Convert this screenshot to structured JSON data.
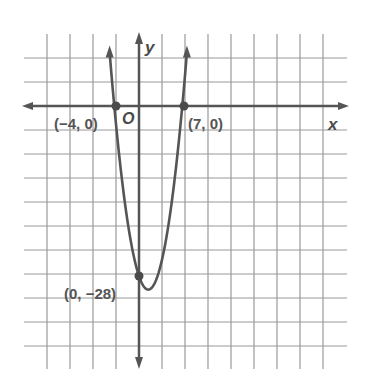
{
  "chart_data": {
    "type": "line",
    "title": "",
    "function": "y = (x + 4)(x - 7) = x^2 - 3x - 28",
    "xlabel": "x",
    "ylabel": "y",
    "origin_label": "O",
    "grid": true,
    "x_units_per_grid_approx": 3.5,
    "y_units_per_grid_approx": 4,
    "points": [
      {
        "x": -4,
        "y": 0,
        "label": "(−4, 0)"
      },
      {
        "x": 7,
        "y": 0,
        "label": "(7, 0)"
      },
      {
        "x": 0,
        "y": -28,
        "label": "(0, −28)"
      }
    ],
    "vertex": {
      "x": 1.5,
      "y": -30.25
    },
    "series": [
      {
        "name": "parabola",
        "x": [
          -4.6,
          -4,
          -2,
          0,
          1.5,
          3,
          5,
          7,
          7.6
        ],
        "y": [
          5.76,
          0,
          -18,
          -28,
          -30.25,
          -28,
          -18,
          0,
          5.76
        ]
      }
    ],
    "colors": {
      "curve": "#555555",
      "axis": "#555555",
      "grid": "#9a9a9a",
      "points": "#4a4a4a"
    }
  },
  "labels": {
    "x_axis": "x",
    "y_axis": "y",
    "origin": "O",
    "p1": "(−4, 0)",
    "p2": "(7, 0)",
    "p3": "(0, −28)"
  }
}
